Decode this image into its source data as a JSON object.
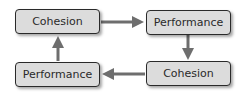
{
  "diagram": {
    "type": "cycle",
    "nodes": [
      {
        "id": "tl",
        "label": "Cohesion"
      },
      {
        "id": "tr",
        "label": "Performance"
      },
      {
        "id": "br",
        "label": "Cohesion"
      },
      {
        "id": "bl",
        "label": "Performance"
      }
    ],
    "edges": [
      {
        "from": "tl",
        "to": "tr"
      },
      {
        "from": "tr",
        "to": "br"
      },
      {
        "from": "br",
        "to": "bl"
      },
      {
        "from": "bl",
        "to": "tl"
      }
    ],
    "colors": {
      "box_fill": "#dcdcdc",
      "border": "#2a2a2a",
      "arrow": "#707070"
    }
  }
}
